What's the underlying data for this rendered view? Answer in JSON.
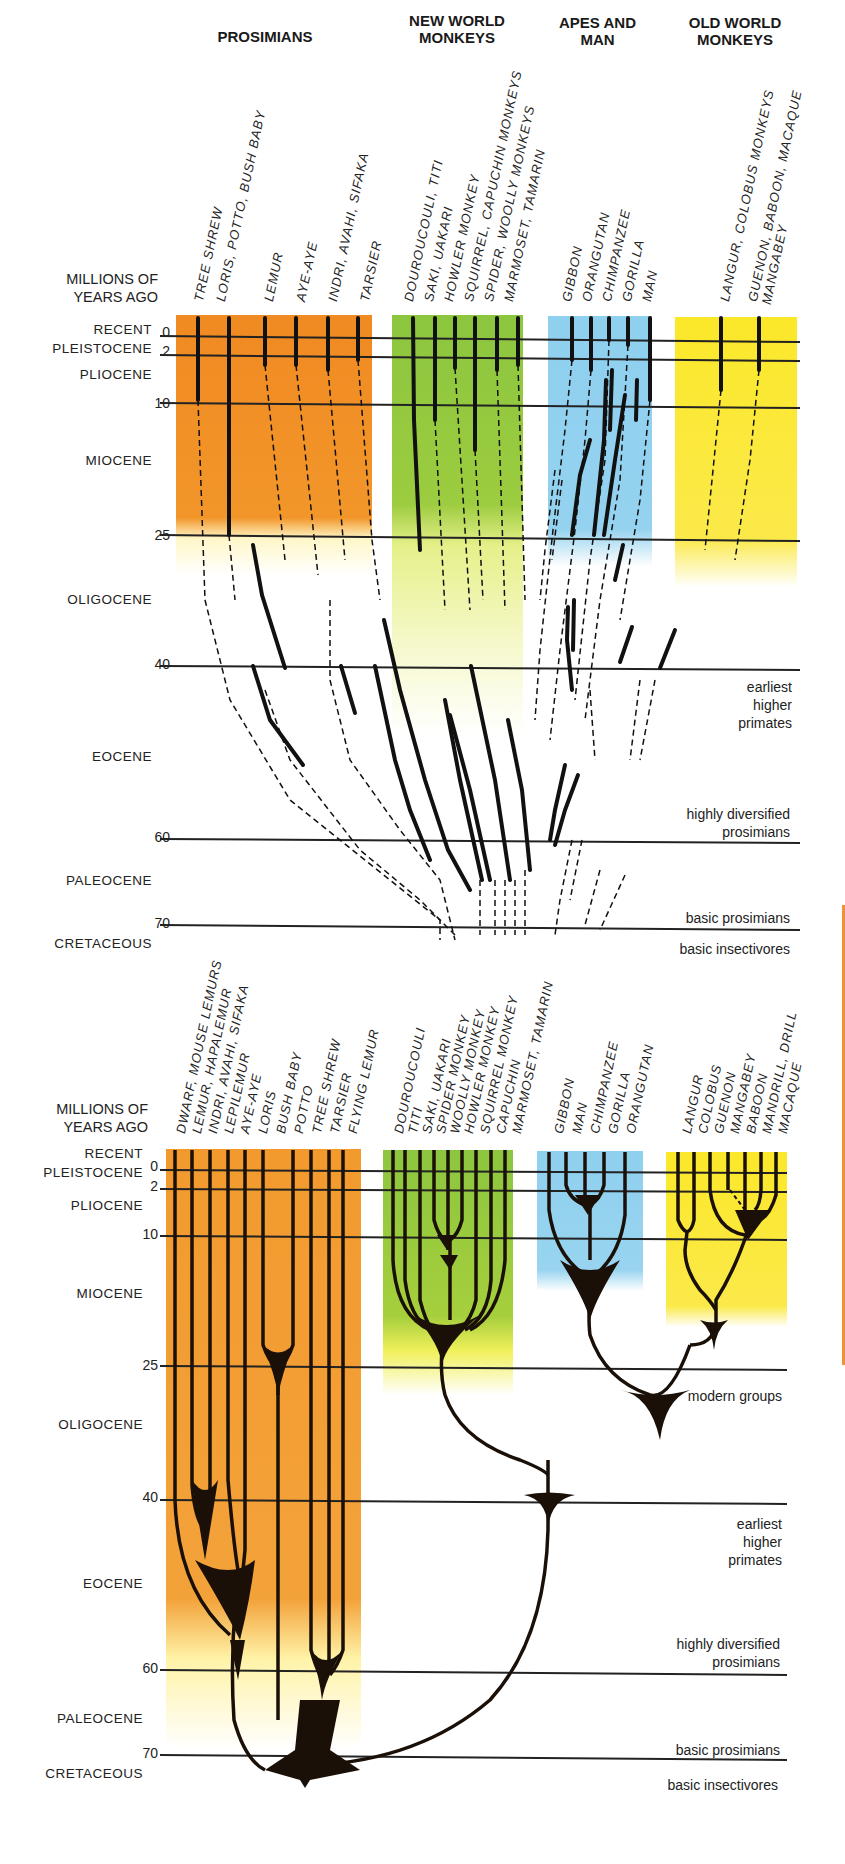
{
  "top_chart": {
    "groups": [
      {
        "label": "PROSIMIANS",
        "color": "#f08a22"
      },
      {
        "label": "NEW WORLD\nMONKEYS",
        "color": "#8cc63f"
      },
      {
        "label": "APES AND\nMAN",
        "color": "#8fd0ef"
      },
      {
        "label": "OLD WORLD\nMONKEYS",
        "color": "#fbe82a"
      }
    ],
    "axis_title": "MILLIONS OF\nYEARS AGO",
    "species": [
      "TREE SHREW",
      "LORIS, POTTO, BUSH BABY",
      "LEMUR",
      "AYE-AYE",
      "INDRI, AVAHI, SIFAKA",
      "TARSIER",
      "DOUROUCOULI, TITI",
      "SAKI, UAKARI",
      "HOWLER MONKEY",
      "SQUIRREL, CAPUCHIN MONKEYS",
      "SPIDER, WOOLLY MONKEYS",
      "MARMOSET, TAMARIN",
      "GIBBON",
      "ORANGUTAN",
      "CHIMPANZEE",
      "GORILLA",
      "MAN",
      "LANGUR, COLOBUS MONKEYS",
      "GUENON, BABOON, MACAQUE\nMANGABEY"
    ],
    "epochs": [
      "RECENT",
      "PLEISTOCENE",
      "PLIOCENE",
      "MIOCENE",
      "OLIGOCENE",
      "EOCENE",
      "PALEOCENE",
      "CRETACEOUS"
    ],
    "ticks": [
      "0",
      "2",
      "10",
      "25",
      "40",
      "60",
      "70"
    ],
    "notes": [
      "modern groups",
      "earliest\nhigher\nprimates",
      "highly diversified\nprosimians",
      "basic prosimians",
      "basic insectivores"
    ]
  },
  "bottom_chart": {
    "axis_title": "MILLIONS OF\nYEARS AGO",
    "species": [
      "DWARF, MOUSE LEMURS",
      "LEMUR, HAPALEMUR",
      "INDRI, AVAHI, SIFAKA",
      "LEPILEMUR",
      "AYE-AYE",
      "LORIS",
      "BUSH BABY",
      "POTTO",
      "TREE SHREW",
      "TARSIER",
      "FLYING LEMUR",
      "DOUROUCOULI",
      "TITI",
      "SAKI, UAKARI",
      "SPIDER MONKEY",
      "WOOLLY MONKEY",
      "HOWLER MONKEY",
      "SQUIRREL MONKEY",
      "CAPUCHIN",
      "MARMOSET, TAMARIN",
      "GIBBON",
      "MAN",
      "CHIMPANZEE",
      "GORILLA",
      "ORANGUTAN",
      "LANGUR",
      "COLOBUS",
      "GUENON",
      "MANGABEY",
      "BABOON",
      "MANDRILL, DRILL",
      "MACAQUE"
    ],
    "epochs": [
      "RECENT",
      "PLEISTOCENE",
      "PLIOCENE",
      "MIOCENE",
      "OLIGOCENE",
      "EOCENE",
      "PALEOCENE",
      "CRETACEOUS"
    ],
    "ticks": [
      "0",
      "2",
      "10",
      "25",
      "40",
      "60",
      "70"
    ],
    "notes": [
      "modern groups",
      "earliest\nhigher\nprimates",
      "highly diversified\nprosimians",
      "basic prosimians",
      "basic insectivores"
    ]
  }
}
